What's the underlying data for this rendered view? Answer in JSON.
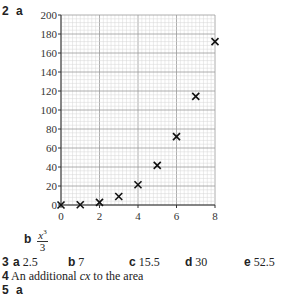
{
  "question2": {
    "number": "2",
    "part_a": "a",
    "part_b": "b",
    "part_b_fraction": {
      "numerator": "x",
      "exponent": "3",
      "denominator": "3"
    }
  },
  "chart_data": {
    "type": "scatter",
    "title": "",
    "xlabel": "",
    "ylabel": "",
    "marker": "x",
    "grid": true,
    "xlim": [
      0,
      8
    ],
    "ylim": [
      0,
      200
    ],
    "x_ticks": [
      "0",
      "2",
      "4",
      "6",
      "8"
    ],
    "y_ticks": [
      "0",
      "20",
      "40",
      "60",
      "80",
      "100",
      "120",
      "140",
      "160",
      "180",
      "200"
    ],
    "x": [
      0,
      1,
      2,
      3,
      4,
      5,
      6,
      7,
      8
    ],
    "y": [
      0,
      0.3,
      2.7,
      9,
      21.3,
      41.7,
      72,
      114.3,
      172
    ]
  },
  "question3": {
    "number": "3",
    "answers": [
      {
        "label": "a",
        "value": "2.5"
      },
      {
        "label": "b",
        "value": "7"
      },
      {
        "label": "c",
        "value": "15.5"
      },
      {
        "label": "d",
        "value": "30"
      },
      {
        "label": "e",
        "value": "52.5"
      }
    ]
  },
  "question4": {
    "number": "4",
    "text_before": "An additional ",
    "text_italic": "cx",
    "text_after": " to the area"
  },
  "question5": {
    "number": "5",
    "part": "a"
  }
}
